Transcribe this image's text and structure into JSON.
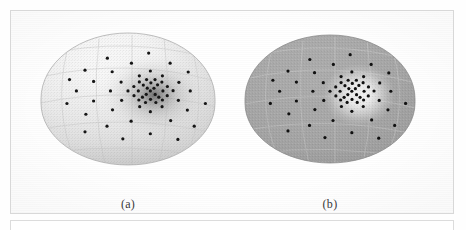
{
  "figure": {
    "panels": [
      {
        "id": "a",
        "caption": "(a)",
        "surface_color": "#f2f2f2",
        "surface_highlight": "#fdfdfd",
        "surface_shadow": "#b9b9b9",
        "grid_color": "#cfcfcf",
        "density_cloud": "dark",
        "density_color": "#5a5a5a",
        "point_color": "#151515",
        "description": "hemisphere with dark kernel-density shading around point cluster"
      },
      {
        "id": "b",
        "caption": "(b)",
        "surface_color": "#a8a8a8",
        "surface_highlight": "#ffffff",
        "surface_shadow": "#8f8f8f",
        "grid_color": "#c4c4c4",
        "density_cloud": "light",
        "density_color": "#ffffff",
        "point_color": "#101010",
        "description": "hemisphere uniform gray with bright white halo around point cluster"
      }
    ],
    "cluster_center": {
      "x": 0.63,
      "y": 0.42
    },
    "point_radius_px": 1.6,
    "points": [
      [
        0.63,
        0.42
      ],
      [
        0.612,
        0.398
      ],
      [
        0.651,
        0.399
      ],
      [
        0.606,
        0.447
      ],
      [
        0.658,
        0.448
      ],
      [
        0.589,
        0.374
      ],
      [
        0.672,
        0.372
      ],
      [
        0.584,
        0.47
      ],
      [
        0.679,
        0.47
      ],
      [
        0.633,
        0.356
      ],
      [
        0.631,
        0.487
      ],
      [
        0.56,
        0.42
      ],
      [
        0.703,
        0.42
      ],
      [
        0.566,
        0.349
      ],
      [
        0.697,
        0.35
      ],
      [
        0.563,
        0.492
      ],
      [
        0.7,
        0.492
      ],
      [
        0.608,
        0.33
      ],
      [
        0.657,
        0.33
      ],
      [
        0.602,
        0.512
      ],
      [
        0.662,
        0.512
      ],
      [
        0.534,
        0.385
      ],
      [
        0.729,
        0.385
      ],
      [
        0.535,
        0.458
      ],
      [
        0.728,
        0.458
      ],
      [
        0.5,
        0.42
      ],
      [
        0.762,
        0.418
      ],
      [
        0.566,
        0.3
      ],
      [
        0.7,
        0.3
      ],
      [
        0.568,
        0.545
      ],
      [
        0.698,
        0.545
      ],
      [
        0.46,
        0.35
      ],
      [
        0.796,
        0.352
      ],
      [
        0.463,
        0.495
      ],
      [
        0.793,
        0.495
      ],
      [
        0.63,
        0.262
      ],
      [
        0.63,
        0.585
      ],
      [
        0.398,
        0.42
      ],
      [
        0.862,
        0.42
      ],
      [
        0.408,
        0.268
      ],
      [
        0.85,
        0.27
      ],
      [
        0.41,
        0.57
      ],
      [
        0.845,
        0.572
      ],
      [
        0.3,
        0.345
      ],
      [
        0.3,
        0.5
      ],
      [
        0.52,
        0.2
      ],
      [
        0.745,
        0.2
      ],
      [
        0.518,
        0.66
      ],
      [
        0.748,
        0.655
      ],
      [
        0.2,
        0.42
      ],
      [
        0.25,
        0.255
      ],
      [
        0.255,
        0.605
      ],
      [
        0.38,
        0.16
      ],
      [
        0.88,
        0.162
      ],
      [
        0.378,
        0.7
      ],
      [
        0.885,
        0.7
      ],
      [
        0.145,
        0.52
      ],
      [
        0.16,
        0.33
      ],
      [
        0.62,
        0.12
      ],
      [
        0.63,
        0.76
      ],
      [
        0.47,
        0.8
      ],
      [
        0.79,
        0.805
      ],
      [
        0.25,
        0.745
      ],
      [
        0.95,
        0.52
      ]
    ]
  }
}
